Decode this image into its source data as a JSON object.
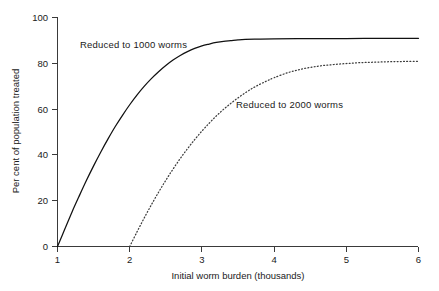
{
  "chart_data": {
    "type": "line",
    "title": "",
    "subtitle": "",
    "xlabel": "Initial worm burden (thousands)",
    "ylabel": "Per cent of population treated",
    "xlim": [
      1,
      6
    ],
    "ylim": [
      0,
      100
    ],
    "xticks": [
      1,
      2,
      3,
      4,
      5,
      6
    ],
    "xtick_labels": [
      "1",
      "2",
      "3",
      "4",
      "5",
      "6"
    ],
    "yticks": [
      0,
      20,
      40,
      60,
      80,
      100
    ],
    "ytick_labels": [
      "0",
      "20",
      "40",
      "60",
      "80",
      "100"
    ],
    "grid": false,
    "legend_position": "inline-annotations",
    "series": [
      {
        "name": "Reduced to 1000 worms",
        "style": "solid",
        "color": "#111111",
        "annotation": "Reduced to 1000 worms",
        "x": [
          1.0,
          1.1,
          1.2,
          1.3,
          1.4,
          1.5,
          1.6,
          1.7,
          1.8,
          1.9,
          2.0,
          2.1,
          2.2,
          2.3,
          2.4,
          2.5,
          2.6,
          2.7,
          2.8,
          2.9,
          3.0,
          3.1,
          3.2,
          3.3,
          3.4,
          3.5,
          3.6,
          3.8,
          4.0,
          4.5,
          5.0,
          5.5,
          6.0
        ],
        "values": [
          0,
          7.5,
          15.0,
          22.0,
          28.8,
          35.2,
          41.3,
          47.0,
          52.4,
          57.3,
          61.9,
          66.1,
          69.9,
          73.3,
          76.3,
          79.0,
          81.4,
          83.4,
          85.1,
          86.5,
          87.6,
          88.4,
          89.1,
          89.6,
          89.9,
          90.2,
          90.4,
          90.6,
          90.7,
          90.8,
          90.8,
          90.9,
          90.9
        ]
      },
      {
        "name": "Reduced to 2000 worms",
        "style": "dotted",
        "color": "#3b3b3b",
        "annotation": "Reduced to 2000 worms",
        "x": [
          2.0,
          2.1,
          2.2,
          2.3,
          2.4,
          2.5,
          2.6,
          2.7,
          2.8,
          2.9,
          3.0,
          3.1,
          3.2,
          3.3,
          3.4,
          3.5,
          3.6,
          3.7,
          3.8,
          3.9,
          4.0,
          4.2,
          4.4,
          4.6,
          4.8,
          5.0,
          5.2,
          5.4,
          5.6,
          5.8,
          6.0
        ],
        "values": [
          0,
          6.3,
          12.4,
          18.2,
          23.7,
          28.9,
          33.8,
          38.4,
          42.7,
          46.7,
          50.4,
          53.8,
          57.0,
          59.9,
          62.5,
          64.9,
          67.1,
          69.1,
          70.8,
          72.3,
          73.7,
          76.0,
          77.6,
          78.7,
          79.4,
          79.9,
          80.3,
          80.5,
          80.7,
          80.8,
          80.9
        ]
      }
    ]
  },
  "annotations": {
    "solid_label": "Reduced to 1000 worms",
    "dotted_label": "Reduced to 2000 worms"
  },
  "axes": {
    "x_title": "Initial worm burden (thousands)",
    "y_title": "Per cent of population treated"
  }
}
